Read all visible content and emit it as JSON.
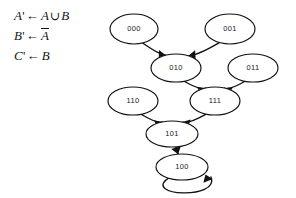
{
  "equations": [
    {
      "lhs": "A",
      "prime": "'",
      "arrow": "←",
      "rhs_prefix": "A",
      "operator": "∪",
      "rhs_suffix": "B",
      "overbar": false
    },
    {
      "lhs": "B",
      "prime": "'",
      "arrow": "←",
      "rhs_prefix": "A",
      "operator": "",
      "rhs_suffix": "",
      "overbar": true
    },
    {
      "lhs": "C",
      "prime": "'",
      "arrow": "←",
      "rhs_prefix": "B",
      "operator": "",
      "rhs_suffix": "",
      "overbar": false
    }
  ],
  "graph": {
    "nodes": [
      {
        "id": "000",
        "label": "000",
        "cx": 134,
        "cy": 29,
        "rx": 24,
        "ry": 15
      },
      {
        "id": "001",
        "label": "001",
        "cx": 230,
        "cy": 29,
        "rx": 25,
        "ry": 15
      },
      {
        "id": "010",
        "label": "010",
        "cx": 176,
        "cy": 68,
        "rx": 25,
        "ry": 14
      },
      {
        "id": "011",
        "label": "011",
        "cx": 253,
        "cy": 68,
        "rx": 25,
        "ry": 14
      },
      {
        "id": "110",
        "label": "110",
        "cx": 133,
        "cy": 101,
        "rx": 25,
        "ry": 14
      },
      {
        "id": "111",
        "label": "111",
        "cx": 215,
        "cy": 101,
        "rx": 25,
        "ry": 14
      },
      {
        "id": "101",
        "label": "101",
        "cx": 172,
        "cy": 134,
        "rx": 26,
        "ry": 13
      },
      {
        "id": "100",
        "label": "100",
        "cx": 182,
        "cy": 167,
        "rx": 26,
        "ry": 13
      }
    ],
    "edges": [
      {
        "from": "000",
        "to": "010",
        "kind": "curve"
      },
      {
        "from": "001",
        "to": "010",
        "kind": "curve"
      },
      {
        "from": "010",
        "to": "111",
        "kind": "curve"
      },
      {
        "from": "011",
        "to": "111",
        "kind": "curve"
      },
      {
        "from": "110",
        "to": "101",
        "kind": "curve"
      },
      {
        "from": "111",
        "to": "101",
        "kind": "curve"
      },
      {
        "from": "101",
        "to": "100",
        "kind": "straight"
      },
      {
        "from": "100",
        "to": "100",
        "kind": "self-loop"
      }
    ]
  },
  "colors": {
    "ink": "#111111",
    "background": "#ffffff"
  }
}
